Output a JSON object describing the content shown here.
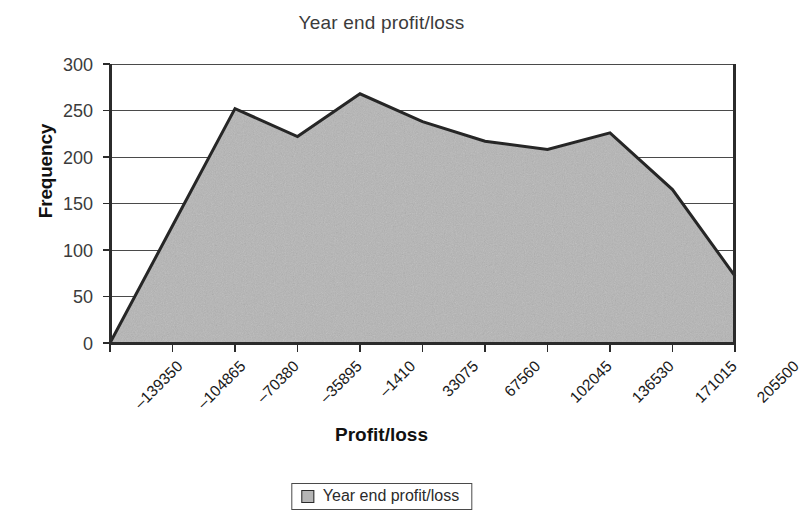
{
  "chart_data": {
    "type": "area",
    "title": "Year end profit/loss",
    "xlabel": "Profit/loss",
    "ylabel": "Frequency",
    "categories": [
      "–139350",
      "–104865",
      "–70380",
      "–35895",
      "–1410",
      "33075",
      "67560",
      "102045",
      "136530",
      "171015",
      "205500"
    ],
    "values": [
      0,
      126,
      252,
      222,
      268,
      238,
      217,
      208,
      226,
      165,
      72
    ],
    "series": [
      {
        "name": "Year end profit/loss",
        "values": [
          0,
          126,
          252,
          222,
          268,
          238,
          217,
          208,
          226,
          165,
          72
        ]
      }
    ],
    "ylim": [
      0,
      300
    ],
    "y_ticks": [
      "0",
      "50",
      "100",
      "150",
      "200",
      "250",
      "300"
    ],
    "grid": true,
    "legend_position": "bottom",
    "legend_entries": [
      "Year end profit/loss"
    ],
    "colors": {
      "area_fill": "#b5b5b5",
      "line": "#262626",
      "gridline": "#4a4a4a",
      "axis": "#2b2b2b",
      "title_text": "#3b3b3b"
    }
  }
}
